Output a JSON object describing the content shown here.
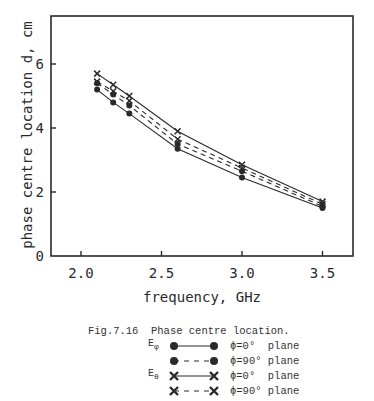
{
  "chart_data": {
    "type": "line",
    "title": "",
    "xlabel": "frequency, GHz",
    "ylabel": "phase centre location d, cm",
    "xlim": [
      1.8,
      3.7
    ],
    "ylim": [
      0,
      7.5
    ],
    "xticks": [
      2.0,
      2.5,
      3.0,
      3.5
    ],
    "xtick_labels": [
      "2.0",
      "2.5",
      "3.0",
      "3.5"
    ],
    "yticks": [
      0,
      2,
      4,
      6
    ],
    "ytick_labels": [
      "0",
      "2",
      "4",
      "6"
    ],
    "grid": false,
    "legend_position": "below",
    "x": [
      2.1,
      2.2,
      2.3,
      2.6,
      3.0,
      3.5
    ],
    "series": [
      {
        "name": "E_phi, phi=0° plane",
        "field": "E_phi",
        "plane": "phi=0° plane",
        "marker": "dot",
        "linestyle": "solid",
        "values": [
          5.2,
          4.8,
          4.45,
          3.35,
          2.45,
          1.5
        ]
      },
      {
        "name": "E_phi, phi=90° plane",
        "field": "E_phi",
        "plane": "phi=90° plane",
        "marker": "dot",
        "linestyle": "dashed",
        "values": [
          5.4,
          5.05,
          4.7,
          3.5,
          2.65,
          1.55
        ]
      },
      {
        "name": "E_theta, phi=0° plane",
        "field": "E_theta",
        "plane": "phi=0° plane",
        "marker": "cross",
        "linestyle": "solid",
        "values": [
          5.7,
          5.35,
          5.0,
          3.9,
          2.85,
          1.7
        ]
      },
      {
        "name": "E_theta, phi=90° plane",
        "field": "E_theta",
        "plane": "phi=90° plane",
        "marker": "cross",
        "linestyle": "dashed",
        "values": [
          5.45,
          5.15,
          4.85,
          3.65,
          2.75,
          1.62
        ]
      }
    ]
  },
  "figure": {
    "caption": "Fig.7.16  Phase centre location."
  },
  "legend": {
    "items": [
      {
        "field_letter": "E",
        "field_sub": "φ",
        "label": "ϕ=0°  plane"
      },
      {
        "field_letter": "",
        "field_sub": "",
        "label": "ϕ=90° plane"
      },
      {
        "field_letter": "E",
        "field_sub": "θ",
        "label": "ϕ=0°  plane"
      },
      {
        "field_letter": "",
        "field_sub": "",
        "label": "ϕ=90° plane"
      }
    ]
  },
  "colors": {
    "ink": "#2a2a2a",
    "background": "#ffffff"
  }
}
